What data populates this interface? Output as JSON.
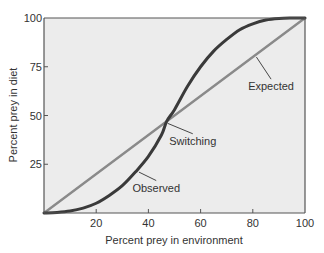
{
  "chart_data": {
    "type": "line",
    "title": "",
    "xlabel": "Percent prey in environment",
    "ylabel": "Percent prey in diet",
    "xlim": [
      0,
      100
    ],
    "ylim": [
      0,
      100
    ],
    "x_ticks": [
      20,
      40,
      60,
      80,
      100
    ],
    "y_ticks": [
      25,
      50,
      75,
      100
    ],
    "grid": false,
    "legend": "none (inline annotations)",
    "series": [
      {
        "name": "Expected",
        "color": "#8a8a8a",
        "x": [
          0,
          100
        ],
        "y": [
          0,
          100
        ]
      },
      {
        "name": "Observed",
        "color": "#3a3a3a",
        "x": [
          0,
          5,
          10,
          15,
          20,
          25,
          30,
          35,
          40,
          45,
          47,
          50,
          55,
          60,
          65,
          70,
          75,
          80,
          85,
          90,
          95,
          100
        ],
        "y": [
          0,
          0.3,
          1,
          2.5,
          5,
          9,
          14,
          21,
          29,
          40,
          47,
          53,
          65,
          75,
          83,
          89,
          94,
          97,
          99,
          99.8,
          100,
          100
        ]
      }
    ],
    "annotations": [
      {
        "text": "Expected",
        "x": 87,
        "y": 63,
        "points_to": [
          81,
          81
        ]
      },
      {
        "text": "Switching",
        "x": 57,
        "y": 35,
        "points_to": [
          47,
          47
        ]
      },
      {
        "text": "Observed",
        "x": 43,
        "y": 11,
        "points_to": [
          36,
          22
        ]
      }
    ],
    "background_color": "#ececec",
    "axis_color": "#555555"
  }
}
